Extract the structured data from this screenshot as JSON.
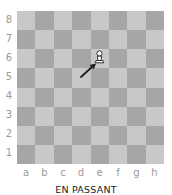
{
  "diagram": {
    "caption": "EN PASSANT",
    "ranks": [
      "8",
      "7",
      "6",
      "5",
      "4",
      "3",
      "2",
      "1"
    ],
    "files": [
      "a",
      "b",
      "c",
      "d",
      "e",
      "f",
      "g",
      "h"
    ],
    "colors": {
      "light": "#c8c8c8",
      "dark": "#a6a6a6",
      "label": "#9a9a9a",
      "caption": "#222222"
    },
    "pieces": [
      {
        "type": "pawn",
        "color": "white",
        "square": "e6"
      }
    ],
    "arrows": [
      {
        "from": "d5",
        "to": "e6",
        "color": "#222222"
      }
    ]
  }
}
